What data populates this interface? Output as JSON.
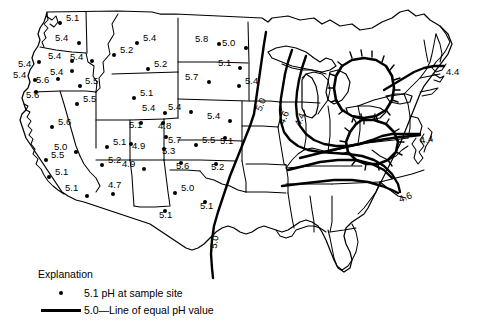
{
  "figure": {
    "type": "contour-map",
    "region": "Contiguous United States",
    "quantity": "pH"
  },
  "legend": {
    "title": "Explanation",
    "point_symbol_name": "sample-site-dot",
    "point_value": "5.1",
    "point_label": "5.1 pH at sample site",
    "line_symbol_name": "isopleth-line",
    "line_value": "5.0",
    "line_label": "5.0—Line of equal pH value"
  },
  "sample_sites": [
    {
      "label": "5.1",
      "value": 5.1,
      "x": 60,
      "y": 23,
      "dx": 6,
      "dy": -5,
      "state": "WA"
    },
    {
      "label": "5.4",
      "value": 5.4,
      "x": 79,
      "y": 43,
      "dx": -24,
      "dy": -5,
      "state": "WA"
    },
    {
      "label": "5.4",
      "value": 5.4,
      "x": 72,
      "y": 61,
      "dx": -24,
      "dy": -5,
      "state": "OR"
    },
    {
      "label": "5.4",
      "value": 5.4,
      "x": 39,
      "y": 62,
      "dx": -21,
      "dy": 2,
      "state": "OR"
    },
    {
      "label": "5.4",
      "value": 5.4,
      "x": 72,
      "y": 71,
      "dx": -22,
      "dy": 1,
      "state": "OR"
    },
    {
      "label": "5.4",
      "value": 5.4,
      "x": 35,
      "y": 80,
      "dx": -22,
      "dy": -5,
      "state": "OR"
    },
    {
      "label": "5.6",
      "value": 5.6,
      "x": 58,
      "y": 79,
      "dx": -22,
      "dy": 1,
      "state": "OR"
    },
    {
      "label": "5.6",
      "value": 5.6,
      "x": 36,
      "y": 92,
      "dx": -10,
      "dy": 3,
      "state": "OR"
    },
    {
      "label": "5.4",
      "value": 5.4,
      "x": 92,
      "y": 61,
      "dx": -22,
      "dy": -4,
      "state": "ID"
    },
    {
      "label": "5.5",
      "value": 5.5,
      "x": 80,
      "y": 86,
      "dx": 5,
      "dy": -5,
      "state": "ID"
    },
    {
      "label": "5.4",
      "value": 5.4,
      "x": 137,
      "y": 43,
      "dx": 6,
      "dy": -5,
      "state": "MT"
    },
    {
      "label": "5.2",
      "value": 5.2,
      "x": 114,
      "y": 55,
      "dx": 6,
      "dy": -5,
      "state": "MT"
    },
    {
      "label": "5.2",
      "value": 5.2,
      "x": 148,
      "y": 69,
      "dx": 6,
      "dy": -5,
      "state": "MT"
    },
    {
      "label": "5.8",
      "value": 5.8,
      "x": 219,
      "y": 44,
      "dx": -24,
      "dy": -5,
      "state": "ND"
    },
    {
      "label": "5.0",
      "value": 5.0,
      "x": 246,
      "y": 48,
      "dx": -24,
      "dy": -5,
      "state": "MN"
    },
    {
      "label": "5.1",
      "value": 5.1,
      "x": 240,
      "y": 68,
      "dx": -22,
      "dy": -5,
      "state": "MN"
    },
    {
      "label": "5.4",
      "value": 5.4,
      "x": 239,
      "y": 86,
      "dx": 6,
      "dy": -5,
      "state": "MN"
    },
    {
      "label": "5.7",
      "value": 5.7,
      "x": 209,
      "y": 82,
      "dx": -24,
      "dy": -5,
      "state": "SD"
    },
    {
      "label": "5.1",
      "value": 5.1,
      "x": 134,
      "y": 98,
      "dx": 6,
      "dy": -5,
      "state": "WY"
    },
    {
      "label": "5.4",
      "value": 5.4,
      "x": 165,
      "y": 113,
      "dx": -23,
      "dy": -5,
      "state": "WY"
    },
    {
      "label": "5.4",
      "value": 5.4,
      "x": 191,
      "y": 112,
      "dx": -23,
      "dy": -5,
      "state": "NE"
    },
    {
      "label": "5.4",
      "value": 5.4,
      "x": 230,
      "y": 121,
      "dx": -23,
      "dy": -5,
      "state": "NE"
    },
    {
      "label": "5.5",
      "value": 5.5,
      "x": 77,
      "y": 104,
      "dx": 6,
      "dy": -5,
      "state": "NV"
    },
    {
      "label": "5.6",
      "value": 5.6,
      "x": 52,
      "y": 127,
      "dx": 6,
      "dy": -5,
      "state": "NV"
    },
    {
      "label": "5.0",
      "value": 5.0,
      "x": 76,
      "y": 152,
      "dx": -22,
      "dy": -5,
      "state": "NV"
    },
    {
      "label": "5.5",
      "value": 5.5,
      "x": 46,
      "y": 160,
      "dx": 5,
      "dy": -5,
      "state": "CA"
    },
    {
      "label": "5.1",
      "value": 5.1,
      "x": 49,
      "y": 177,
      "dx": 6,
      "dy": -5,
      "state": "CA"
    },
    {
      "label": "5.1",
      "value": 5.1,
      "x": 107,
      "y": 147,
      "dx": 6,
      "dy": -5,
      "state": "UT"
    },
    {
      "label": "5.2",
      "value": 5.2,
      "x": 102,
      "y": 165,
      "dx": 6,
      "dy": -5,
      "state": "UT"
    },
    {
      "label": "5.1",
      "value": 5.1,
      "x": 141,
      "y": 123,
      "dx": -12,
      "dy": 2,
      "state": "CO"
    },
    {
      "label": "4.8",
      "value": 4.8,
      "x": 163,
      "y": 123,
      "dx": -5,
      "dy": 3,
      "state": "CO"
    },
    {
      "label": "5.7",
      "value": 5.7,
      "x": 166,
      "y": 137,
      "dx": 2,
      "dy": 3,
      "state": "CO"
    },
    {
      "label": "5.3",
      "value": 5.3,
      "x": 164,
      "y": 149,
      "dx": -2,
      "dy": 2,
      "state": "CO"
    },
    {
      "label": "4.9",
      "value": 4.9,
      "x": 131,
      "y": 144,
      "dx": 1,
      "dy": 2,
      "state": "CO"
    },
    {
      "label": "4.9",
      "value": 4.9,
      "x": 144,
      "y": 169,
      "dx": -22,
      "dy": -5,
      "state": "NM"
    },
    {
      "label": "5.1",
      "value": 5.1,
      "x": 87,
      "y": 196,
      "dx": -22,
      "dy": -8,
      "state": "AZ"
    },
    {
      "label": "4.7",
      "value": 4.7,
      "x": 113,
      "y": 194,
      "dx": -5,
      "dy": -9,
      "state": "AZ"
    },
    {
      "label": "5.5",
      "value": 5.5,
      "x": 196,
      "y": 145,
      "dx": 6,
      "dy": -5,
      "state": "KS"
    },
    {
      "label": "5.1",
      "value": 5.1,
      "x": 225,
      "y": 138,
      "dx": -5,
      "dy": 3,
      "state": "KS"
    },
    {
      "label": "5.6",
      "value": 5.6,
      "x": 181,
      "y": 163,
      "dx": -5,
      "dy": 3,
      "state": "OK"
    },
    {
      "label": "5.2",
      "value": 5.2,
      "x": 216,
      "y": 164,
      "dx": -5,
      "dy": 3,
      "state": "OK"
    },
    {
      "label": "5.0",
      "value": 5.0,
      "x": 175,
      "y": 193,
      "dx": 6,
      "dy": -5,
      "state": "TX"
    },
    {
      "label": "5.1",
      "value": 5.1,
      "x": 205,
      "y": 202,
      "dx": -5,
      "dy": 4,
      "state": "TX"
    },
    {
      "label": "5.1",
      "value": 5.1,
      "x": 165,
      "y": 211,
      "dx": -6,
      "dy": 4,
      "state": "TX"
    }
  ],
  "contour_labels": [
    {
      "value": "5.0",
      "x": 258,
      "y": 105,
      "rot": -68,
      "name": "isopleth-label-5-0-midwest"
    },
    {
      "value": "4.6",
      "x": 281,
      "y": 118,
      "rot": -68,
      "name": "isopleth-label-4-6-midwest"
    },
    {
      "value": "4.4",
      "x": 297,
      "y": 120,
      "rot": -68,
      "name": "isopleth-label-4-4-midwest"
    },
    {
      "value": "4.4",
      "x": 446,
      "y": 66,
      "rot": 0,
      "name": "isopleth-label-4-4-northeast"
    },
    {
      "value": "4.4",
      "x": 420,
      "y": 135,
      "rot": -10,
      "name": "isopleth-label-4-4-midatlantic"
    },
    {
      "value": "4.6",
      "x": 399,
      "y": 194,
      "rot": -22,
      "name": "isopleth-label-4-6-southeast"
    },
    {
      "value": "5.0",
      "x": 213,
      "y": 243,
      "rot": -80,
      "name": "isopleth-label-5-0-texas"
    }
  ]
}
